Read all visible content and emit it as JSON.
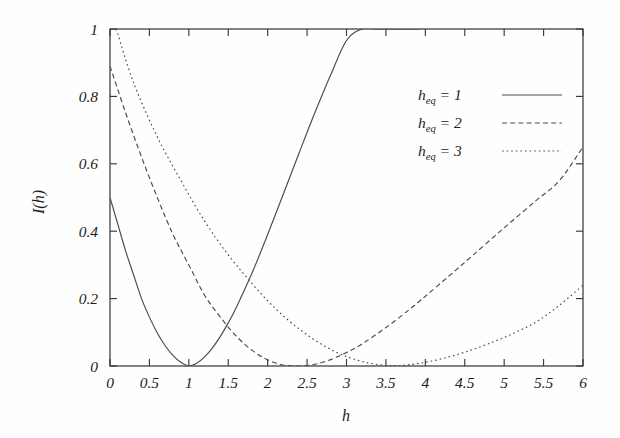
{
  "figure": {
    "background": "#fefefe",
    "ink_color": "#3a3a3a",
    "curve_color": "#4a4a4a"
  },
  "axes": {
    "x_title": "h",
    "y_title": "I(h)",
    "x_ticks": [
      "0",
      "0.5",
      "1",
      "1.5",
      "2",
      "2.5",
      "3",
      "3.5",
      "4",
      "4.5",
      "5",
      "5.5",
      "6"
    ],
    "y_ticks": [
      "0",
      "0.2",
      "0.4",
      "0.6",
      "0.8",
      "1"
    ]
  },
  "legend": {
    "entries": [
      {
        "base": "h",
        "sub": "eq",
        "eq": "= 1",
        "style": "solid"
      },
      {
        "base": "h",
        "sub": "eq",
        "eq": "= 2",
        "style": "dashed"
      },
      {
        "base": "h",
        "sub": "eq",
        "eq": "= 3",
        "style": "dotted"
      }
    ]
  },
  "chart_data": {
    "type": "line",
    "title": "",
    "xlabel": "h",
    "ylabel": "I(h)",
    "xlim": [
      0,
      6
    ],
    "ylim": [
      0,
      1
    ],
    "xticks": [
      0,
      0.5,
      1,
      1.5,
      2,
      2.5,
      3,
      3.5,
      4,
      4.5,
      5,
      5.5,
      6
    ],
    "yticks": [
      0,
      0.2,
      0.4,
      0.6,
      0.8,
      1
    ],
    "grid": false,
    "legend_position": "upper right",
    "series": [
      {
        "name": "h_eq = 1",
        "style": "solid",
        "h_eq": 1,
        "x": [
          0,
          0.1,
          0.2,
          0.3,
          0.4,
          0.5,
          0.6,
          0.7,
          0.8,
          0.9,
          1.0,
          1.1,
          1.2,
          1.3,
          1.4,
          1.5,
          1.6,
          1.8,
          2.0,
          2.2,
          2.4,
          2.6,
          2.8,
          3.0,
          3.2,
          3.4,
          3.6,
          3.8,
          3.92
        ],
        "y": [
          0.5,
          0.42,
          0.34,
          0.27,
          0.2,
          0.145,
          0.098,
          0.06,
          0.031,
          0.011,
          0.0,
          0.008,
          0.027,
          0.054,
          0.088,
          0.128,
          0.173,
          0.275,
          0.39,
          0.511,
          0.633,
          0.752,
          0.864,
          0.966,
          1.0,
          1.0,
          1.0,
          1.0,
          1.0
        ]
      },
      {
        "name": "h_eq = 2",
        "style": "dashed",
        "h_eq": 2,
        "x": [
          0,
          0.2,
          0.4,
          0.6,
          0.8,
          1.0,
          1.2,
          1.4,
          1.6,
          1.8,
          2.0,
          2.2,
          2.4,
          2.6,
          2.8,
          3.0,
          3.2,
          3.5,
          3.8,
          4.0,
          4.3,
          4.6,
          5.0,
          5.4,
          5.7,
          6.0
        ],
        "y": [
          0.89,
          0.75,
          0.62,
          0.5,
          0.39,
          0.3,
          0.21,
          0.145,
          0.089,
          0.047,
          0.018,
          0.003,
          0.0,
          0.005,
          0.019,
          0.04,
          0.066,
          0.114,
          0.168,
          0.207,
          0.267,
          0.328,
          0.41,
          0.49,
          0.55,
          0.65
        ]
      },
      {
        "name": "h_eq = 3",
        "style": "dotted",
        "h_eq": 3,
        "x": [
          0.08,
          0.3,
          0.6,
          0.9,
          1.2,
          1.5,
          1.8,
          2.1,
          2.4,
          2.7,
          3.0,
          3.3,
          3.6,
          3.9,
          4.2,
          4.5,
          4.8,
          5.1,
          5.4,
          5.7,
          6.0
        ],
        "y": [
          1.0,
          0.84,
          0.68,
          0.55,
          0.43,
          0.33,
          0.245,
          0.17,
          0.11,
          0.062,
          0.028,
          0.008,
          0.001,
          0.007,
          0.021,
          0.041,
          0.066,
          0.095,
          0.13,
          0.18,
          0.24
        ]
      }
    ]
  }
}
